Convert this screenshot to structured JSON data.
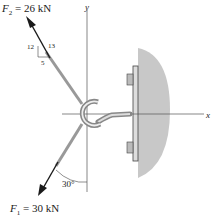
{
  "diagram": {
    "forces": [
      {
        "name": "F2",
        "label": "F",
        "sub": "2",
        "value_text": " = 26 kN",
        "slope": {
          "rise": "12",
          "hypotenuse": "13",
          "run": "5"
        }
      },
      {
        "name": "F1",
        "label": "F",
        "sub": "1",
        "value_text": " = 30 kN",
        "angle": "30°"
      }
    ],
    "axes": {
      "x": "x",
      "y": "y"
    },
    "colors": {
      "support": "#c8c8c8",
      "arrow": "#1a1a1a",
      "axis": "#555555"
    }
  }
}
